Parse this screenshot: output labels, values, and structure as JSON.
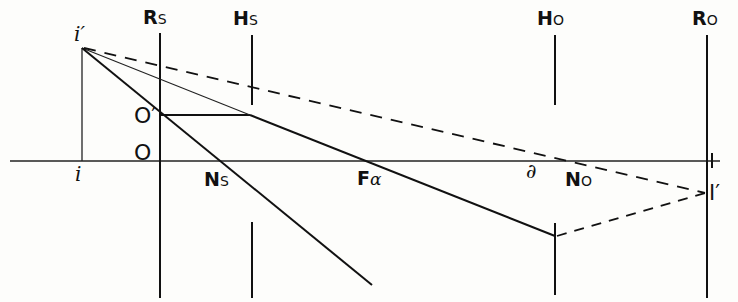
{
  "figure": {
    "colors": {
      "ink": "#111111",
      "background": "#fdfdfb"
    },
    "labels": {
      "rs_main": "R",
      "rs_sub": "S",
      "hs_main": "H",
      "hs_sub": "S",
      "ho_main": "H",
      "ho_sub": "O",
      "ro_main": "R",
      "ro_sub": "O",
      "i_prime": "i′",
      "i": "i",
      "o_prime": "O′",
      "o": "O",
      "ns_main": "N",
      "ns_sub": "S",
      "fa_main": "F",
      "fa_sub": "α",
      "delta": "∂",
      "no_main": "N",
      "no_sub": "O",
      "big_i_prime": "I′"
    }
  }
}
